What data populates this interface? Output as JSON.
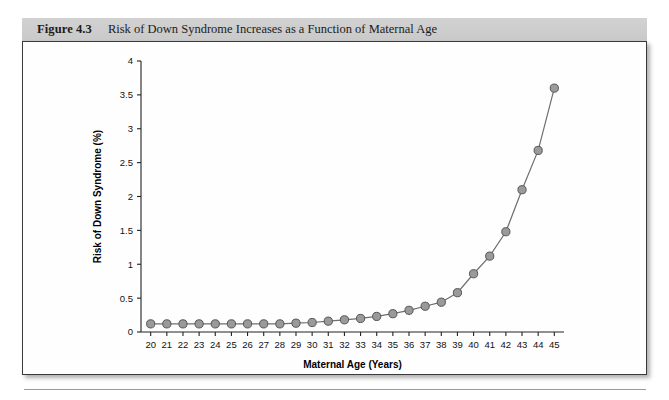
{
  "figure": {
    "number_label": "Figure 4.3",
    "title": "Risk of Down Syndrome Increases as a Function of Maternal Age"
  },
  "colors": {
    "caption_bar": "#cfcfcf",
    "marker_fill": "#9a9a9a",
    "marker_stroke": "#555555",
    "line": "#6e6e6e",
    "axis": "#222222",
    "panel_border": "#3a3a3a"
  },
  "chart_data": {
    "type": "line",
    "title": "Risk of Down Syndrome Increases as a Function of Maternal Age",
    "xlabel": "Maternal Age (Years)",
    "ylabel": "Risk of Down Syndrome (%)",
    "xlim": [
      19.4,
      45.6
    ],
    "ylim": [
      0,
      4
    ],
    "grid": false,
    "legend": null,
    "xticks": [
      20,
      21,
      22,
      23,
      24,
      25,
      26,
      27,
      28,
      29,
      30,
      31,
      32,
      33,
      34,
      35,
      36,
      37,
      38,
      39,
      40,
      41,
      42,
      43,
      44,
      45
    ],
    "xtick_labels": [
      "20",
      "21",
      "22",
      "23",
      "24",
      "25",
      "26",
      "27",
      "28",
      "29",
      "30",
      "31",
      "32",
      "33",
      "34",
      "35",
      "36",
      "37",
      "38",
      "39",
      "40",
      "41",
      "42",
      "43",
      "44",
      "45"
    ],
    "yticks": [
      0,
      0.5,
      1,
      1.5,
      2,
      2.5,
      3,
      3.5,
      4
    ],
    "ytick_labels": [
      "0",
      "0.5",
      "1",
      "1.5",
      "2",
      "2.5",
      "3",
      "3.5",
      "4"
    ],
    "marker": "circle",
    "x": [
      20,
      21,
      22,
      23,
      24,
      25,
      26,
      27,
      28,
      29,
      30,
      31,
      32,
      33,
      34,
      35,
      36,
      37,
      38,
      39,
      40,
      41,
      42,
      43,
      44,
      45
    ],
    "values": [
      0.12,
      0.12,
      0.12,
      0.12,
      0.12,
      0.12,
      0.12,
      0.12,
      0.12,
      0.13,
      0.14,
      0.16,
      0.18,
      0.2,
      0.23,
      0.27,
      0.32,
      0.38,
      0.44,
      0.58,
      0.86,
      1.12,
      1.48,
      2.1,
      2.68,
      3.6
    ],
    "series": [
      {
        "name": "Risk of Down Syndrome (%)",
        "values": [
          0.12,
          0.12,
          0.12,
          0.12,
          0.12,
          0.12,
          0.12,
          0.12,
          0.12,
          0.13,
          0.14,
          0.16,
          0.18,
          0.2,
          0.23,
          0.27,
          0.32,
          0.38,
          0.44,
          0.58,
          0.86,
          1.12,
          1.48,
          2.1,
          2.68,
          3.6
        ]
      }
    ]
  }
}
